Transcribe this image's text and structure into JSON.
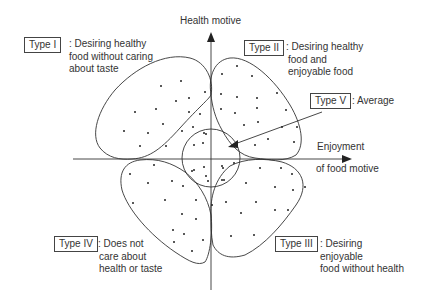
{
  "axes": {
    "y_label": "Health motive",
    "x_label_line1": "Enjoyment",
    "x_label_line2": "of food motive"
  },
  "types": [
    {
      "name": "Type I",
      "desc": [
        ": Desiring healthy",
        "food without caring",
        "about taste"
      ]
    },
    {
      "name": "Type II",
      "desc": [
        ": Desiring healthy",
        "food and",
        "enjoyable food"
      ]
    },
    {
      "name": "Type III",
      "desc": [
        ": Desiring",
        "enjoyable",
        "food without health"
      ]
    },
    {
      "name": "Type IV",
      "desc": [
        ": Does not",
        "care about",
        "health or taste"
      ]
    },
    {
      "name": "Type V",
      "desc": [
        ": Average"
      ]
    }
  ],
  "colors": {
    "line": "#333333",
    "dot": "#222222"
  }
}
